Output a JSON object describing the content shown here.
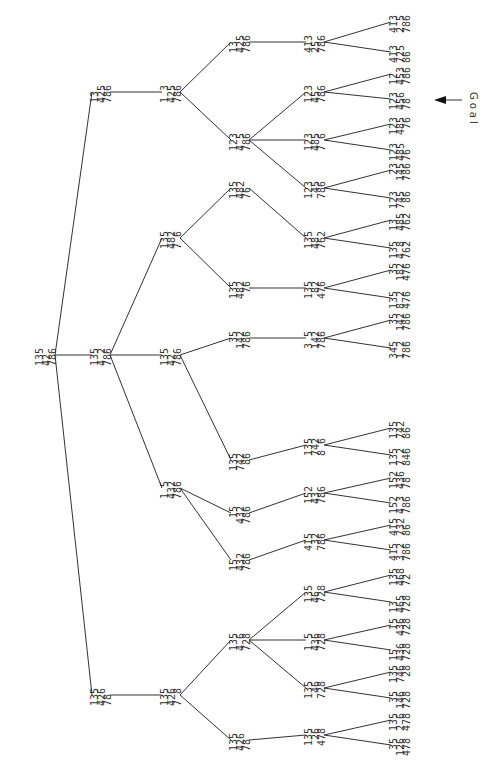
{
  "diagram": {
    "type": "search-tree",
    "orientation": "rotated-90",
    "goal_label": "Goal",
    "nodes": [
      {
        "id": "n0",
        "rows": [
          "135",
          "42 ",
          "786"
        ],
        "x": 46,
        "y": 355
      },
      {
        "id": "n1a",
        "rows": [
          "13 ",
          "425",
          "786"
        ],
        "x": 101,
        "y": 92
      },
      {
        "id": "n1b",
        "rows": [
          "135",
          "4 2",
          "786"
        ],
        "x": 101,
        "y": 355
      },
      {
        "id": "n1c",
        "rows": [
          "135",
          "426",
          "78 "
        ],
        "x": 101,
        "y": 695
      },
      {
        "id": "n2a",
        "rows": [
          "1 3",
          "425",
          "786"
        ],
        "x": 171,
        "y": 92
      },
      {
        "id": "n2b",
        "rows": [
          "135",
          "482",
          "7 6"
        ],
        "x": 171,
        "y": 238
      },
      {
        "id": "n2c",
        "rows": [
          "135",
          "42 ",
          "786"
        ],
        "x": 171,
        "y": 355
      },
      {
        "id": "n2d",
        "rows": [
          "1 5",
          "432",
          "786"
        ],
        "x": 171,
        "y": 488
      },
      {
        "id": "n2e",
        "rows": [
          "135",
          "426",
          "7 8"
        ],
        "x": 171,
        "y": 695
      },
      {
        "id": "n3a",
        "rows": [
          "13 ",
          "425",
          "786"
        ],
        "x": 240,
        "y": 42
      },
      {
        "id": "n3b",
        "rows": [
          "123",
          "4 5",
          "786"
        ],
        "x": 240,
        "y": 140
      },
      {
        "id": "n3c",
        "rows": [
          "135",
          "482",
          "76 "
        ],
        "x": 240,
        "y": 188
      },
      {
        "id": "n3d",
        "rows": [
          "135",
          "482",
          " 76"
        ],
        "x": 240,
        "y": 288
      },
      {
        "id": "n3e",
        "rows": [
          " 35",
          "142",
          "786"
        ],
        "x": 240,
        "y": 338
      },
      {
        "id": "n3f",
        "rows": [
          "135",
          "742",
          " 86"
        ],
        "x": 240,
        "y": 460
      },
      {
        "id": "n3g",
        "rows": [
          " 15",
          "432",
          "786"
        ],
        "x": 240,
        "y": 513
      },
      {
        "id": "n3h",
        "rows": [
          "15 ",
          "432",
          "786"
        ],
        "x": 240,
        "y": 560
      },
      {
        "id": "n3i",
        "rows": [
          "135",
          "4 6",
          "728"
        ],
        "x": 240,
        "y": 640
      },
      {
        "id": "n3j",
        "rows": [
          "135",
          "426",
          "78 "
        ],
        "x": 240,
        "y": 740
      },
      {
        "id": "n4a",
        "rows": [
          "413",
          "25 ",
          "786"
        ],
        "x": 315,
        "y": 42
      },
      {
        "id": "n4b",
        "rows": [
          "123",
          "45 ",
          "786"
        ],
        "x": 315,
        "y": 92
      },
      {
        "id": "n4c",
        "rows": [
          "123",
          "485",
          "7 6"
        ],
        "x": 315,
        "y": 140
      },
      {
        "id": "n4d",
        "rows": [
          "123",
          " 45",
          "786"
        ],
        "x": 315,
        "y": 188
      },
      {
        "id": "n4e",
        "rows": [
          "135",
          "48 ",
          "762"
        ],
        "x": 315,
        "y": 238
      },
      {
        "id": "n4f",
        "rows": [
          "135",
          " 82",
          "476"
        ],
        "x": 315,
        "y": 288
      },
      {
        "id": "n4g",
        "rows": [
          "3 5",
          "142",
          "786"
        ],
        "x": 315,
        "y": 338
      },
      {
        "id": "n4h",
        "rows": [
          "135",
          "742",
          "8 6"
        ],
        "x": 315,
        "y": 445
      },
      {
        "id": "n4i",
        "rows": [
          "152",
          "43 ",
          "786"
        ],
        "x": 315,
        "y": 493
      },
      {
        "id": "n4j",
        "rows": [
          "415",
          " 32",
          "786"
        ],
        "x": 315,
        "y": 540
      },
      {
        "id": "n4k",
        "rows": [
          "135",
          "46 ",
          "728"
        ],
        "x": 315,
        "y": 592
      },
      {
        "id": "n4l",
        "rows": [
          "1 5",
          "436",
          "728"
        ],
        "x": 315,
        "y": 640
      },
      {
        "id": "n4m",
        "rows": [
          "135",
          " 46",
          "728"
        ],
        "x": 315,
        "y": 688
      },
      {
        "id": "n4n",
        "rows": [
          "135",
          " 26",
          "478"
        ],
        "x": 315,
        "y": 735
      },
      {
        "id": "l01",
        "rows": [
          "413",
          "2 5",
          "786"
        ],
        "x": 400,
        "y": 22
      },
      {
        "id": "l02",
        "rows": [
          "413",
          "725",
          "86 "
        ],
        "x": 400,
        "y": 52
      },
      {
        "id": "l03",
        "rows": [
          "12 ",
          "453",
          "786"
        ],
        "x": 400,
        "y": 74
      },
      {
        "id": "l04",
        "rows": [
          "123",
          "456",
          "78 "
        ],
        "x": 400,
        "y": 99,
        "goal": true
      },
      {
        "id": "l05",
        "rows": [
          "123",
          "485",
          " 76"
        ],
        "x": 400,
        "y": 124
      },
      {
        "id": "l06",
        "rows": [
          "123",
          "485",
          "76 "
        ],
        "x": 400,
        "y": 150
      },
      {
        "id": "l07",
        "rows": [
          " 23",
          "145",
          "786"
        ],
        "x": 400,
        "y": 170
      },
      {
        "id": "l08",
        "rows": [
          "123",
          "745",
          " 86"
        ],
        "x": 400,
        "y": 198
      },
      {
        "id": "l09",
        "rows": [
          "13 ",
          "485",
          "762"
        ],
        "x": 400,
        "y": 220
      },
      {
        "id": "l10",
        "rows": [
          "135",
          "4 8",
          "762"
        ],
        "x": 400,
        "y": 248
      },
      {
        "id": "l11",
        "rows": [
          " 35",
          "182",
          "476"
        ],
        "x": 400,
        "y": 270
      },
      {
        "id": "l12",
        "rows": [
          "135",
          "8 2",
          "476"
        ],
        "x": 400,
        "y": 298
      },
      {
        "id": "l13",
        "rows": [
          " 35",
          "142",
          "786"
        ],
        "x": 400,
        "y": 320
      },
      {
        "id": "l14",
        "rows": [
          "345",
          "1 2",
          "786"
        ],
        "x": 400,
        "y": 348
      },
      {
        "id": "l15",
        "rows": [
          "135",
          "742",
          "86 "
        ],
        "x": 400,
        "y": 428
      },
      {
        "id": "l16",
        "rows": [
          "135",
          "7 2",
          "846"
        ],
        "x": 400,
        "y": 455
      },
      {
        "id": "l17",
        "rows": [
          "152",
          "436",
          "78 "
        ],
        "x": 400,
        "y": 478
      },
      {
        "id": "l18",
        "rows": [
          "152",
          "4 3",
          "786"
        ],
        "x": 400,
        "y": 503
      },
      {
        "id": "l19",
        "rows": [
          "415",
          "732",
          "86 "
        ],
        "x": 400,
        "y": 525
      },
      {
        "id": "l20",
        "rows": [
          "415",
          "3 2",
          "786"
        ],
        "x": 400,
        "y": 550
      },
      {
        "id": "l21",
        "rows": [
          "135",
          "468",
          "72 "
        ],
        "x": 400,
        "y": 575
      },
      {
        "id": "l22",
        "rows": [
          "13 ",
          "465",
          "728"
        ],
        "x": 400,
        "y": 602
      },
      {
        "id": "l23",
        "rows": [
          " 15",
          "436",
          "728"
        ],
        "x": 400,
        "y": 625
      },
      {
        "id": "l24",
        "rows": [
          "15 ",
          "436",
          "728"
        ],
        "x": 400,
        "y": 650
      },
      {
        "id": "l25",
        "rows": [
          "135",
          "746",
          " 28"
        ],
        "x": 400,
        "y": 672
      },
      {
        "id": "l26",
        "rows": [
          " 35",
          "146",
          "728"
        ],
        "x": 400,
        "y": 698
      },
      {
        "id": "l27",
        "rows": [
          "135",
          "2 6",
          "478"
        ],
        "x": 400,
        "y": 720
      },
      {
        "id": "l28",
        "rows": [
          " 35",
          "126",
          "478"
        ],
        "x": 400,
        "y": 745
      }
    ],
    "edges": [
      [
        "n0",
        "n1a"
      ],
      [
        "n0",
        "n1b"
      ],
      [
        "n0",
        "n1c"
      ],
      [
        "n1a",
        "n2a"
      ],
      [
        "n1b",
        "n2b"
      ],
      [
        "n1b",
        "n2c"
      ],
      [
        "n1b",
        "n2d"
      ],
      [
        "n1c",
        "n2e"
      ],
      [
        "n2a",
        "n3a"
      ],
      [
        "n2a",
        "n3b"
      ],
      [
        "n2b",
        "n3c"
      ],
      [
        "n2b",
        "n3d"
      ],
      [
        "n2c",
        "n3e"
      ],
      [
        "n2c",
        "n3f"
      ],
      [
        "n2d",
        "n3g"
      ],
      [
        "n2d",
        "n3h"
      ],
      [
        "n2e",
        "n3i"
      ],
      [
        "n2e",
        "n3j"
      ],
      [
        "n3a",
        "n4a"
      ],
      [
        "n3b",
        "n4b"
      ],
      [
        "n3b",
        "n4c"
      ],
      [
        "n3b",
        "n4d"
      ],
      [
        "n3c",
        "n4e"
      ],
      [
        "n3d",
        "n4f"
      ],
      [
        "n3e",
        "n4g"
      ],
      [
        "n3f",
        "n4h"
      ],
      [
        "n3g",
        "n4i"
      ],
      [
        "n3h",
        "n4j"
      ],
      [
        "n3i",
        "n4k"
      ],
      [
        "n3i",
        "n4l"
      ],
      [
        "n3i",
        "n4m"
      ],
      [
        "n3j",
        "n4n"
      ],
      [
        "n4a",
        "l01"
      ],
      [
        "n4a",
        "l02"
      ],
      [
        "n4b",
        "l03"
      ],
      [
        "n4b",
        "l04"
      ],
      [
        "n4c",
        "l05"
      ],
      [
        "n4c",
        "l06"
      ],
      [
        "n4d",
        "l07"
      ],
      [
        "n4d",
        "l08"
      ],
      [
        "n4e",
        "l09"
      ],
      [
        "n4e",
        "l10"
      ],
      [
        "n4f",
        "l11"
      ],
      [
        "n4f",
        "l12"
      ],
      [
        "n4g",
        "l13"
      ],
      [
        "n4g",
        "l14"
      ],
      [
        "n4h",
        "l15"
      ],
      [
        "n4h",
        "l16"
      ],
      [
        "n4i",
        "l17"
      ],
      [
        "n4i",
        "l18"
      ],
      [
        "n4j",
        "l19"
      ],
      [
        "n4j",
        "l20"
      ],
      [
        "n4k",
        "l21"
      ],
      [
        "n4k",
        "l22"
      ],
      [
        "n4l",
        "l23"
      ],
      [
        "n4l",
        "l24"
      ],
      [
        "n4m",
        "l25"
      ],
      [
        "n4m",
        "l26"
      ],
      [
        "n4n",
        "l27"
      ],
      [
        "n4n",
        "l28"
      ]
    ]
  }
}
